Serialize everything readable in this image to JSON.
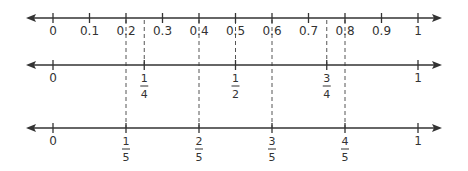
{
  "diagram": {
    "type": "number-lines",
    "colors": {
      "line": "#333333",
      "dashed_guide": "#555555",
      "text": "#333333",
      "background": "#ffffff"
    },
    "lines": [
      {
        "id": "decimals",
        "y": 18,
        "ticks": [
          {
            "value": 0,
            "label": "0"
          },
          {
            "value": 0.1,
            "label": "0.1"
          },
          {
            "value": 0.2,
            "label": "0.2"
          },
          {
            "value": 0.3,
            "label": "0.3"
          },
          {
            "value": 0.4,
            "label": "0.4"
          },
          {
            "value": 0.5,
            "label": "0.5"
          },
          {
            "value": 0.6,
            "label": "0.6"
          },
          {
            "value": 0.7,
            "label": "0.7"
          },
          {
            "value": 0.8,
            "label": "0.8"
          },
          {
            "value": 0.9,
            "label": "0.9"
          },
          {
            "value": 1,
            "label": "1"
          }
        ]
      },
      {
        "id": "fourths",
        "y": 65,
        "ticks": [
          {
            "value": 0,
            "label": "0"
          },
          {
            "value": 0.25,
            "numerator": "1",
            "denominator": "4"
          },
          {
            "value": 0.5,
            "numerator": "1",
            "denominator": "2"
          },
          {
            "value": 0.75,
            "numerator": "3",
            "denominator": "4"
          },
          {
            "value": 1,
            "label": "1"
          }
        ]
      },
      {
        "id": "fifths",
        "y": 128,
        "ticks": [
          {
            "value": 0,
            "label": "0"
          },
          {
            "value": 0.2,
            "numerator": "1",
            "denominator": "5"
          },
          {
            "value": 0.4,
            "numerator": "2",
            "denominator": "5"
          },
          {
            "value": 0.6,
            "numerator": "3",
            "denominator": "5"
          },
          {
            "value": 0.8,
            "numerator": "4",
            "denominator": "5"
          },
          {
            "value": 1,
            "label": "1"
          }
        ]
      }
    ],
    "guides": [
      {
        "value": 0.2,
        "from_line": "decimals",
        "to_line": "fifths"
      },
      {
        "value": 0.25,
        "from_line": "decimals",
        "to_line": "fourths"
      },
      {
        "value": 0.4,
        "from_line": "decimals",
        "to_line": "fifths"
      },
      {
        "value": 0.5,
        "from_line": "decimals",
        "to_line": "fourths"
      },
      {
        "value": 0.6,
        "from_line": "decimals",
        "to_line": "fifths"
      },
      {
        "value": 0.75,
        "from_line": "decimals",
        "to_line": "fourths"
      },
      {
        "value": 0.8,
        "from_line": "decimals",
        "to_line": "fifths"
      }
    ]
  }
}
